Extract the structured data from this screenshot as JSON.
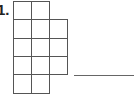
{
  "problem": {
    "number_label": "1.",
    "shape": {
      "description": "grid figure made of unit squares",
      "cell_size_px": 18,
      "origin": {
        "x": 13,
        "y": 1
      },
      "rows": [
        {
          "row": 0,
          "cols": [
            0,
            1
          ]
        },
        {
          "row": 1,
          "cols": [
            0,
            1,
            2
          ]
        },
        {
          "row": 2,
          "cols": [
            0,
            1,
            2
          ]
        },
        {
          "row": 3,
          "cols": [
            0,
            1,
            2
          ]
        },
        {
          "row": 4,
          "cols": [
            0,
            1
          ]
        }
      ],
      "total_squares": 13
    },
    "answer_blank": ""
  },
  "colors": {
    "line": "#555555",
    "background": "#ffffff"
  }
}
